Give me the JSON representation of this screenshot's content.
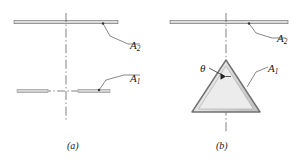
{
  "figure": {
    "type": "engineering-diagram",
    "background_color": "#ffffff",
    "line_color": "#555555",
    "fill_color": "#d9d9d9",
    "text_color": "#1a1a1a",
    "subfigures": [
      {
        "id": "a",
        "caption": "(a)",
        "labels": {
          "plate": "A",
          "plate_sub": "2",
          "surface": "A",
          "surface_sub": "1"
        },
        "elements": [
          "upper-plate-A2",
          "lower-strip-left-A1",
          "lower-strip-right-A1",
          "vertical-centerline",
          "horizontal-centerline",
          "leader-A2",
          "leader-A1"
        ]
      },
      {
        "id": "b",
        "caption": "(b)",
        "labels": {
          "plate": "A",
          "plate_sub": "2",
          "surface": "A",
          "surface_sub": "1",
          "angle": "θ"
        },
        "elements": [
          "upper-plate-A2",
          "triangular-wedge-A1",
          "vertical-centerline",
          "apex-angle-theta",
          "leader-A2",
          "leader-A1",
          "leader-theta"
        ]
      }
    ]
  },
  "geometry": {
    "a": {
      "plate_y": 22,
      "plate_x1": 14,
      "plate_x2": 118,
      "strip_y": 91,
      "strip_left_x1": 17,
      "strip_left_x2": 48,
      "strip_right_x1": 78,
      "strip_right_x2": 110,
      "centerline_x": 66,
      "centerline_y1": 14,
      "centerline_y2": 120
    },
    "b": {
      "plate_y": 22,
      "plate_x1": 170,
      "plate_x2": 288,
      "centerline_x": 226,
      "centerline_y1": 14,
      "centerline_y2": 132,
      "apex_x": 226,
      "apex_y": 60,
      "base_y": 112,
      "base_x1": 192,
      "base_x2": 260,
      "angle_symbol": "θ"
    }
  }
}
